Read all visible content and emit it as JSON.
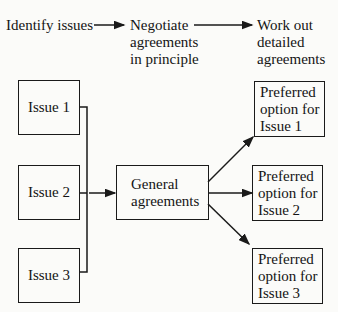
{
  "header": {
    "steps": [
      {
        "label": "Identify issues"
      },
      {
        "label": "Negotiate agreements in principle",
        "lines": [
          "Negotiate",
          "agreements",
          "in principle"
        ]
      },
      {
        "label": "Work out detailed agreements",
        "lines": [
          "Work out",
          "detailed",
          "agreements"
        ]
      }
    ]
  },
  "issues": [
    {
      "label": "Issue 1"
    },
    {
      "label": "Issue 2"
    },
    {
      "label": "Issue 3"
    }
  ],
  "general": {
    "lines": [
      "General",
      "agreements"
    ]
  },
  "preferred": [
    {
      "lines": [
        "Preferred",
        "option for",
        "Issue 1"
      ]
    },
    {
      "lines": [
        "Preferred",
        "option for",
        "Issue 2"
      ]
    },
    {
      "lines": [
        "Preferred",
        "option for",
        "Issue 3"
      ]
    }
  ],
  "colors": {
    "ink": "#1a1a1a",
    "paper": "#fbfbf9"
  }
}
